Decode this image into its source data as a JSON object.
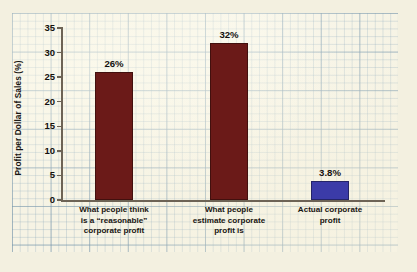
{
  "chart_data": {
    "type": "bar",
    "title": "",
    "subtitle": "",
    "xlabel": "",
    "ylabel": "Profit per Dollar of Sales (%)",
    "ylim": [
      0,
      35
    ],
    "yticks": [
      0,
      5,
      10,
      15,
      20,
      25,
      30,
      35
    ],
    "ytick_labels": [
      "0",
      "5",
      "10",
      "15",
      "20",
      "25",
      "30",
      "35"
    ],
    "grid": true,
    "grid_style": "graph-paper background",
    "legend": null,
    "legend_position": "none",
    "categories": [
      "What people think is a \"reasonable\" corporate profit",
      "What people estimate corporate profit is",
      "Actual corporate profit"
    ],
    "category_lines": [
      [
        "What people think",
        "is a “reasonable”",
        "corporate profit"
      ],
      [
        "What people",
        "estimate corporate",
        "profit is"
      ],
      [
        "Actual corporate",
        "profit"
      ]
    ],
    "values": [
      26,
      32,
      3.8
    ],
    "value_labels": [
      "26%",
      "32%",
      "3.8%"
    ],
    "bar_colors": [
      "#6B1A18",
      "#6B1A18",
      "#3B3BA8"
    ],
    "annotations": []
  },
  "colors": {
    "paper": "#f3f0e0",
    "grid_panel": "#f6f3e4",
    "grid_line": "#87a5b9",
    "axis": "#6d6355",
    "text": "#191512",
    "maroon": "#6B1A18",
    "blue": "#3B3BA8"
  }
}
